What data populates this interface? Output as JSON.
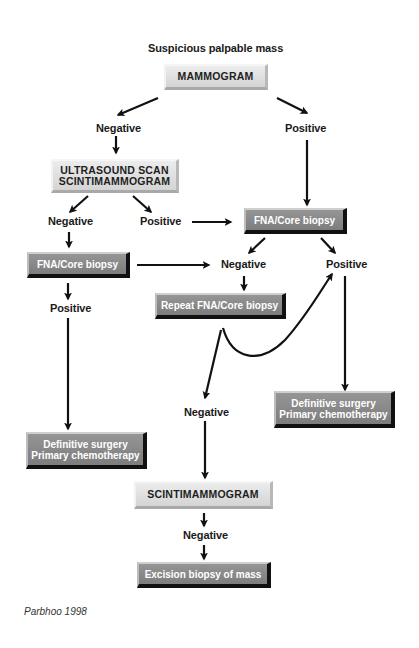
{
  "diagram": {
    "type": "flowchart",
    "title": "Suspicious palpable mass",
    "credit": "Parbhoo 1998",
    "nodes": {
      "mammogram": "MAMMOGRAM",
      "mammo_negative": "Negative",
      "mammo_positive": "Positive",
      "ultrasound_line1": "ULTRASOUND SCAN",
      "ultrasound_line2": "SCINTIMAMMOGRAM",
      "us_negative": "Negative",
      "us_positive": "Positive",
      "fna_left": "FNA/Core biopsy",
      "fna_left_positive": "Positive",
      "fna_right": "FNA/Core biopsy",
      "fna_right_negative": "Negative",
      "fna_right_positive": "Positive",
      "repeat_fna": "Repeat FNA/Core biopsy",
      "repeat_negative": "Negative",
      "def_left_line1": "Definitive surgery",
      "def_left_line2": "Primary chemotherapy",
      "def_right_line1": "Definitive surgery",
      "def_right_line2": "Primary chemotherapy",
      "scinti": "SCINTIMAMMOGRAM",
      "scinti_negative": "Negative",
      "excision": "Excision biopsy of mass"
    },
    "edges": [
      [
        "Suspicious palpable mass",
        "MAMMOGRAM"
      ],
      [
        "MAMMOGRAM",
        "Negative"
      ],
      [
        "MAMMOGRAM",
        "Positive"
      ],
      [
        "Negative",
        "ULTRASOUND SCAN / SCINTIMAMMOGRAM"
      ],
      [
        "Positive",
        "FNA/Core biopsy (right)"
      ],
      [
        "ULTRASOUND SCAN / SCINTIMAMMOGRAM",
        "Negative"
      ],
      [
        "ULTRASOUND SCAN / SCINTIMAMMOGRAM",
        "Positive"
      ],
      [
        "Positive (ultrasound)",
        "FNA/Core biopsy (right)"
      ],
      [
        "Negative (ultrasound)",
        "FNA/Core biopsy (left)"
      ],
      [
        "FNA/Core biopsy (left)",
        "Negative (right)"
      ],
      [
        "FNA/Core biopsy (left)",
        "Positive"
      ],
      [
        "Positive (left)",
        "Definitive surgery / Primary chemotherapy (left)"
      ],
      [
        "FNA/Core biopsy (right)",
        "Negative"
      ],
      [
        "FNA/Core biopsy (right)",
        "Positive"
      ],
      [
        "Negative (right)",
        "Repeat FNA/Core biopsy"
      ],
      [
        "Repeat FNA/Core biopsy",
        "Positive (right)"
      ],
      [
        "Repeat FNA/Core biopsy",
        "Negative"
      ],
      [
        "Positive (right)",
        "Definitive surgery / Primary chemotherapy (right)"
      ],
      [
        "Negative (repeat)",
        "SCINTIMAMMOGRAM"
      ],
      [
        "SCINTIMAMMOGRAM",
        "Negative"
      ],
      [
        "Negative (scinti)",
        "Excision biopsy of mass"
      ]
    ]
  }
}
